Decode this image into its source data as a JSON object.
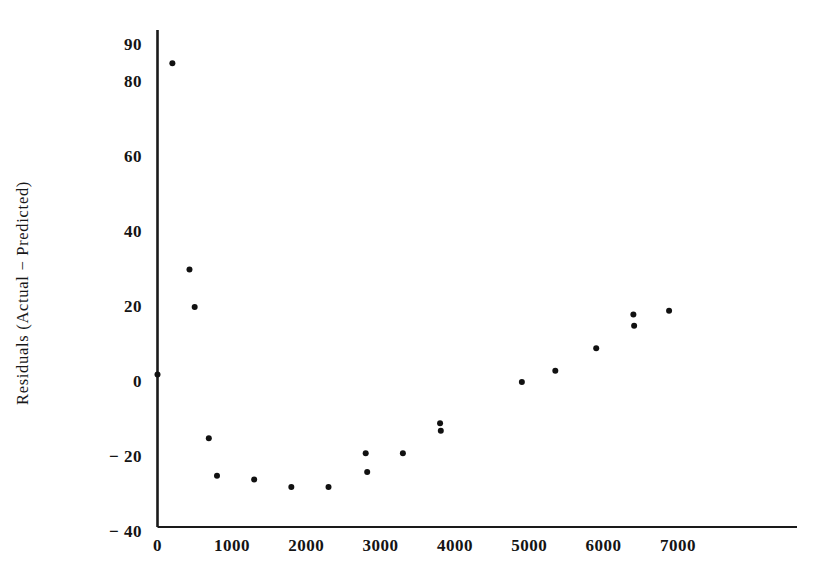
{
  "chart_data": {
    "type": "scatter",
    "title": "",
    "xlabel": "",
    "ylabel": "Residuals  (Actual  −  Predicted)",
    "xlim": [
      0,
      8500
    ],
    "ylim": [
      -40,
      95
    ],
    "grid": false,
    "legend": "none",
    "xticks": [
      "0",
      "1000",
      "2000",
      "3000",
      "4000",
      "5000",
      "6000",
      "7000"
    ],
    "xtick_values": [
      0,
      1000,
      2000,
      3000,
      4000,
      5000,
      6000,
      7000
    ],
    "yticks": [
      "90",
      "80",
      "60",
      "40",
      "20",
      "0",
      "− 20",
      "− 40"
    ],
    "ytick_values": [
      90,
      80,
      60,
      40,
      20,
      0,
      -20,
      -40
    ],
    "marker": "filled-circle",
    "marker_color": "#111111",
    "marker_size": 6,
    "axis_color": "#1a1a1a",
    "background_color": "#ffffff",
    "points": [
      {
        "x": 0,
        "y": 2
      },
      {
        "x": 200,
        "y": 85
      },
      {
        "x": 430,
        "y": 30
      },
      {
        "x": 500,
        "y": 20
      },
      {
        "x": 690,
        "y": -15
      },
      {
        "x": 800,
        "y": -25
      },
      {
        "x": 1300,
        "y": -26
      },
      {
        "x": 1800,
        "y": -28
      },
      {
        "x": 2300,
        "y": -28
      },
      {
        "x": 2800,
        "y": -19
      },
      {
        "x": 2820,
        "y": -24
      },
      {
        "x": 3300,
        "y": -19
      },
      {
        "x": 3800,
        "y": -11
      },
      {
        "x": 3810,
        "y": -13
      },
      {
        "x": 4900,
        "y": 0
      },
      {
        "x": 5350,
        "y": 3
      },
      {
        "x": 5900,
        "y": 9
      },
      {
        "x": 6400,
        "y": 18
      },
      {
        "x": 6410,
        "y": 15
      },
      {
        "x": 6880,
        "y": 19
      }
    ]
  },
  "figure": {
    "y_axis_title": "Residuals  (Actual  −  Predicted)"
  }
}
